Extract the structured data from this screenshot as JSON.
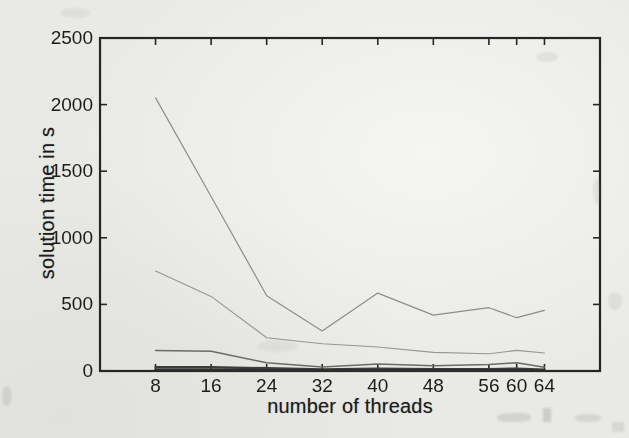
{
  "chart_data": {
    "type": "line",
    "title": "",
    "xlabel": "number of threads",
    "ylabel": "solution time in s",
    "x": [
      8,
      16,
      24,
      32,
      40,
      48,
      56,
      60,
      64
    ],
    "xticks": [
      8,
      16,
      24,
      32,
      40,
      48,
      56,
      60,
      64
    ],
    "yticks": [
      0,
      500,
      1000,
      1500,
      2000,
      2500
    ],
    "xlim": [
      0,
      72
    ],
    "ylim": [
      0,
      2500
    ],
    "grid": false,
    "legend": "none",
    "axis_color": "#262626",
    "text_color": "#1c1c1c",
    "paper_color": "#e9e9e6",
    "series": [
      {
        "name": "line-1",
        "stroke": "#8d8d8d",
        "width": 1.2,
        "values": [
          2050,
          1310,
          565,
          300,
          585,
          420,
          475,
          400,
          455
        ]
      },
      {
        "name": "line-2",
        "stroke": "#969696",
        "width": 1.1,
        "values": [
          750,
          560,
          250,
          205,
          180,
          140,
          130,
          155,
          135
        ]
      },
      {
        "name": "line-3",
        "stroke": "#6b6b6b",
        "width": 1.5,
        "values": [
          155,
          148,
          62,
          30,
          52,
          40,
          48,
          62,
          28
        ]
      },
      {
        "name": "line-4",
        "stroke": "#3c3c3c",
        "width": 2.4,
        "values": [
          28,
          28,
          20,
          12,
          18,
          14,
          14,
          18,
          10
        ]
      },
      {
        "name": "line-5",
        "stroke": "#2e2e2e",
        "width": 2.6,
        "values": [
          8,
          8,
          6,
          5,
          6,
          5,
          5,
          6,
          4
        ]
      }
    ]
  }
}
